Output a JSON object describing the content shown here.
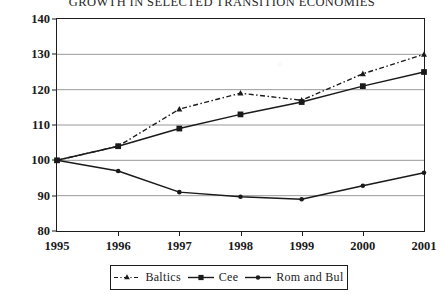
{
  "chart_data": {
    "type": "line",
    "title": "GROWTH IN SELECTED TRANSITION ECONOMIES",
    "xlabel": "",
    "ylabel": "",
    "x": [
      "1995",
      "1996",
      "1997",
      "1998",
      "1999",
      "2000",
      "2001"
    ],
    "categories": [
      "1995",
      "1996",
      "1997",
      "1998",
      "1999",
      "2000",
      "2001"
    ],
    "xlim": [
      1995,
      2001
    ],
    "ylim": [
      80,
      140
    ],
    "yticks": [
      80,
      90,
      100,
      110,
      120,
      130,
      140
    ],
    "ytick_labels": [
      "80",
      "90",
      "100",
      "110",
      "120",
      "130",
      "140"
    ],
    "grid": true,
    "grid_axis": "y",
    "legend_position": "bottom-center",
    "series": [
      {
        "name": "Baltics",
        "values": [
          100,
          104,
          114.5,
          119,
          117,
          124.5,
          130
        ],
        "line_style": "dash-dot",
        "marker": "triangle",
        "color": "#1a1a1a"
      },
      {
        "name": "Cee",
        "values": [
          100,
          104,
          109,
          113,
          116.5,
          121,
          125
        ],
        "line_style": "solid",
        "marker": "square",
        "color": "#1a1a1a"
      },
      {
        "name": "Rom and Bul",
        "values": [
          100,
          97,
          91,
          89.7,
          89,
          92.8,
          96.5
        ],
        "line_style": "solid",
        "marker": "dot",
        "color": "#1a1a1a"
      }
    ]
  },
  "legend": {
    "entries": [
      {
        "label": "Baltics"
      },
      {
        "label": "Cee"
      },
      {
        "label": "Rom and Bul"
      }
    ]
  },
  "colors": {
    "ink": "#1a1a1a",
    "grid": "#8c8c8c",
    "frame": "#1c1c1c",
    "background": "#ffffff"
  }
}
